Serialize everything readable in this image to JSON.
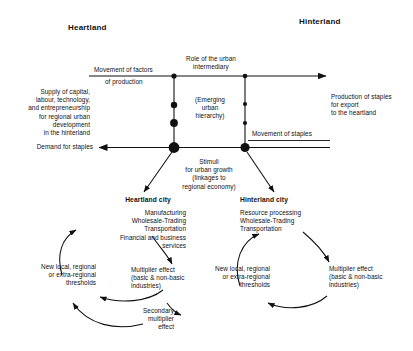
{
  "headers": {
    "left": "Heartland",
    "right": "Hinterland"
  },
  "flows": {
    "top_line_label_above": "Movement of factors",
    "top_line_label_below": "of production",
    "top_center_label": "Role of the urban\nintermediary",
    "left_block": "Supply of capital,\nlabour, technology,\nand entrepreneurship\nfor regional urban\ndevelopment\nin the hinterland",
    "left_bottom_label": "Demand for staples",
    "right_block": "Production of staples\nfor export\nto the heartland",
    "right_bottom_label": "Movement of staples",
    "center_hierarchy": "(Emerging\nurban\nhierarchy)",
    "stimuli": "Stimuli\nfor urban growth\n(linkages to\nregional economy)"
  },
  "heartland_city": {
    "title": "Heartland city",
    "functions": "Manufacturing\nWholesale-Trading\nTransportation\nFinancial and business\nservices",
    "multiplier": "Multiplier effect\n(basic & non-basic\nindustries)",
    "thresholds": "New local, regional\nor extra-regional\nthresholds",
    "secondary": "Secondary\nmultiplier\neffect"
  },
  "hinterland_city": {
    "title": "Hinterland city",
    "functions": "Resource processing\nWholesale-Trading\nTransportation",
    "multiplier": "Multiplier effect\n(basic & non-basic\nindustries)",
    "thresholds": "New local, regional\nor extra-regional\nthresholds"
  },
  "style": {
    "ink": "#111111",
    "paper": "#ffffff"
  }
}
